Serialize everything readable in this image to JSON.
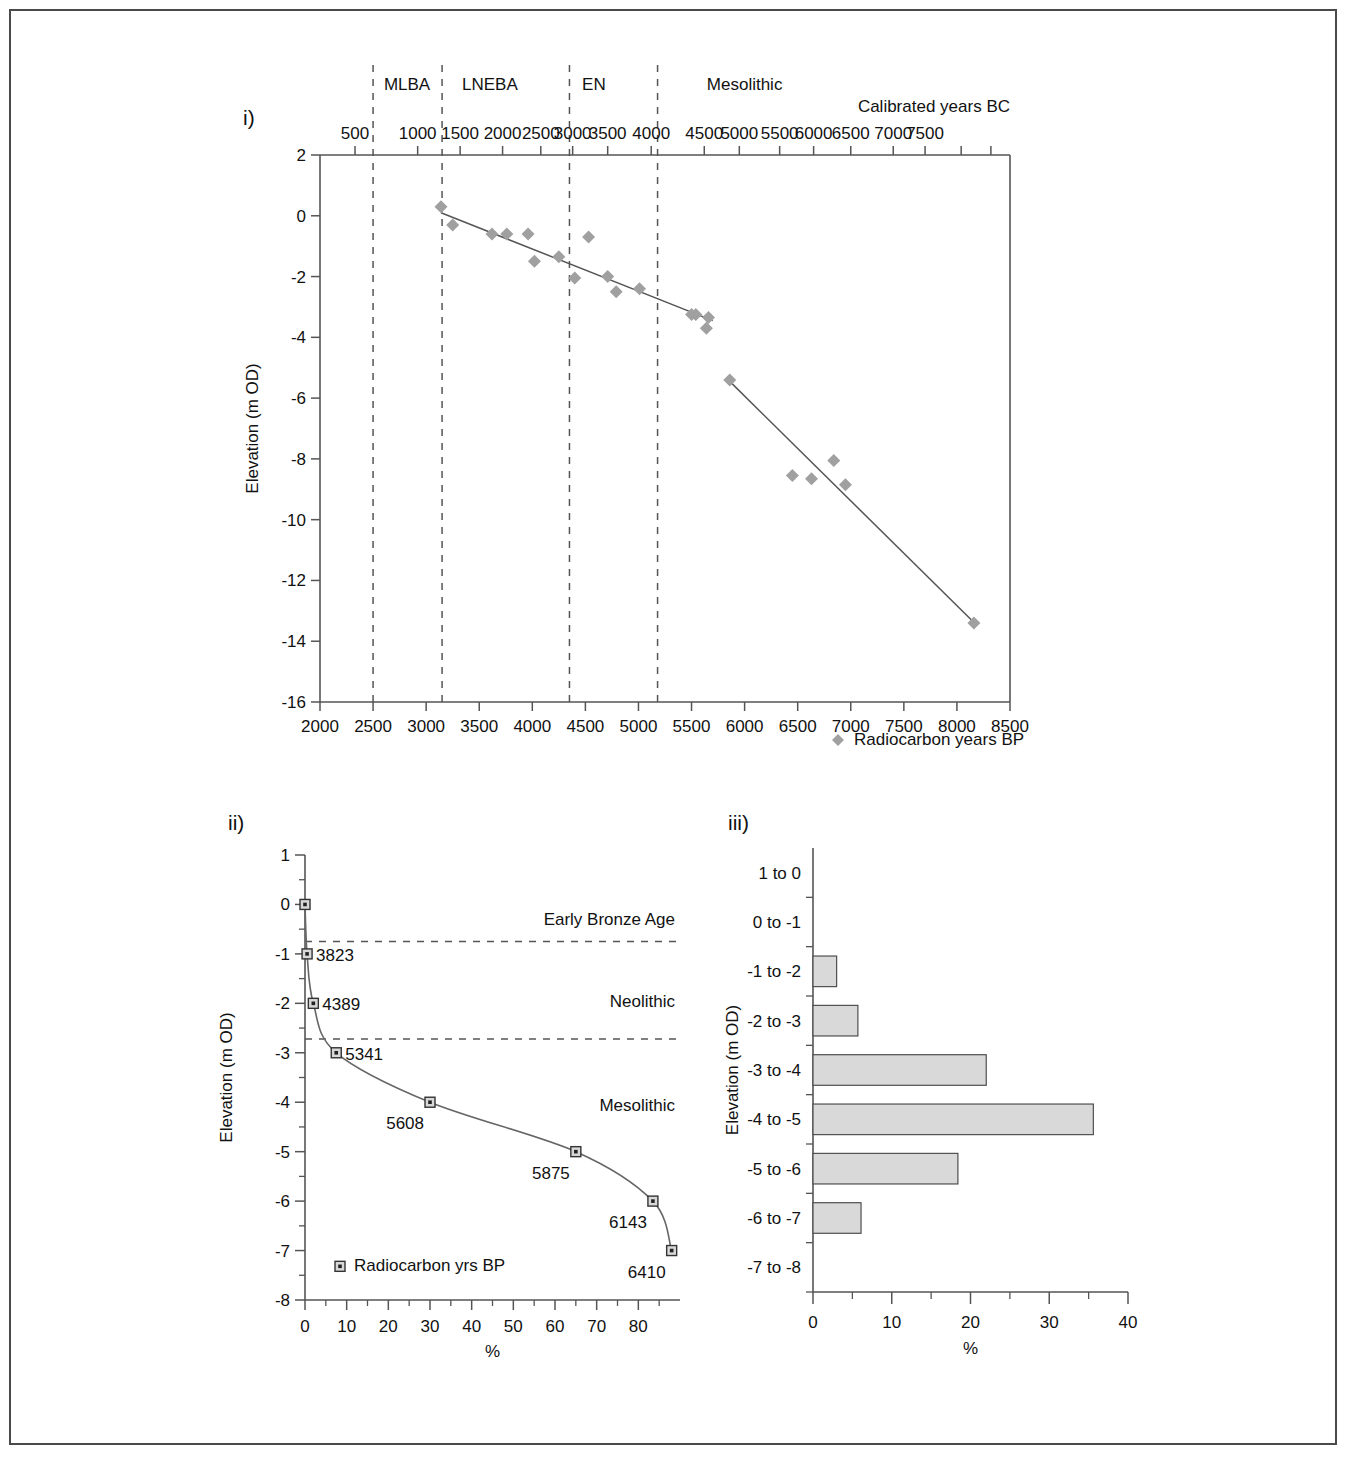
{
  "figure": {
    "panels": [
      {
        "id": "i",
        "label": "i)"
      },
      {
        "id": "ii",
        "label": "ii)"
      },
      {
        "id": "iii",
        "label": "iii)"
      }
    ]
  },
  "chart_data": [
    {
      "panel": "i",
      "type": "scatter",
      "title": "",
      "xlabel": "",
      "ylabel": "Elevation (m OD)",
      "xlim": [
        2000,
        8500
      ],
      "ylim": [
        -16,
        2
      ],
      "grid": false,
      "xticks": [
        2000,
        2500,
        3000,
        3500,
        4000,
        4500,
        5000,
        5500,
        6000,
        6500,
        7000,
        7500,
        8000,
        8500
      ],
      "xticklabels": [
        "2000",
        "2500",
        "3000",
        "3500",
        "4000",
        "4500",
        "5000",
        "5500",
        "6000",
        "6500",
        "7000",
        "7500",
        "8000",
        "8500"
      ],
      "yticks": [
        2,
        0,
        -2,
        -4,
        -6,
        -8,
        -10,
        -12,
        -14,
        -16
      ],
      "yticklabels": [
        "2",
        "0",
        "-2",
        "-4",
        "-6",
        "-8",
        "-10",
        "-12",
        "-14",
        "-16"
      ],
      "top_axis": {
        "label": "Calibrated years BC",
        "ticks_bp": [
          2330,
          2920,
          3320,
          3720,
          4080,
          4380,
          4710,
          5120,
          5620,
          5950,
          6330,
          6650,
          7000,
          7400,
          7700,
          8040,
          8320
        ],
        "ticklabels": [
          "500",
          "1000",
          "1500",
          "2000",
          "2500",
          "3000",
          "3500",
          "4000",
          "4500",
          "5000",
          "5500",
          "6000",
          "6500",
          "7000",
          "7500",
          "",
          ""
        ],
        "displayed": [
          "500",
          "1000",
          "1500",
          "2000",
          "2500",
          "3000",
          "3500",
          "4000",
          "4500",
          "5000",
          "5500",
          "6000",
          "6500",
          "7000",
          "7500"
        ]
      },
      "period_dividers_bp": [
        2500,
        3150,
        4350,
        5180
      ],
      "period_labels": [
        {
          "name": "MLBA",
          "bp": 2820
        },
        {
          "name": "LNEBA",
          "bp": 3600
        },
        {
          "name": "EN",
          "bp": 4580
        },
        {
          "name": "Mesolithic",
          "bp": 6000
        }
      ],
      "legend": {
        "label": "Radiocarbon years BP",
        "marker": "diamond"
      },
      "points": [
        {
          "x": 3140,
          "y": 0.3
        },
        {
          "x": 3250,
          "y": -0.3
        },
        {
          "x": 3620,
          "y": -0.6
        },
        {
          "x": 3760,
          "y": -0.6
        },
        {
          "x": 3960,
          "y": -0.6
        },
        {
          "x": 4020,
          "y": -1.5
        },
        {
          "x": 4250,
          "y": -1.35
        },
        {
          "x": 4400,
          "y": -2.05
        },
        {
          "x": 4530,
          "y": -0.7
        },
        {
          "x": 4710,
          "y": -2.0
        },
        {
          "x": 4790,
          "y": -2.5
        },
        {
          "x": 5010,
          "y": -2.4
        },
        {
          "x": 5500,
          "y": -3.25
        },
        {
          "x": 5540,
          "y": -3.25
        },
        {
          "x": 5660,
          "y": -3.35
        },
        {
          "x": 5640,
          "y": -3.7
        },
        {
          "x": 5860,
          "y": -5.4
        },
        {
          "x": 6450,
          "y": -8.55
        },
        {
          "x": 6630,
          "y": -8.65
        },
        {
          "x": 6840,
          "y": -8.05
        },
        {
          "x": 6950,
          "y": -8.85
        },
        {
          "x": 8160,
          "y": -13.4
        }
      ],
      "trendlines": [
        {
          "x1": 3140,
          "y1": 0.1,
          "x2": 5700,
          "y2": -3.45
        },
        {
          "x1": 5860,
          "y1": -5.45,
          "x2": 8180,
          "y2": -13.45
        }
      ]
    },
    {
      "panel": "ii",
      "type": "line",
      "title": "",
      "xlabel": "%",
      "ylabel": "Elevation (m OD)",
      "xlim": [
        0,
        90
      ],
      "ylim": [
        -8,
        1
      ],
      "grid": false,
      "xticks": [
        0,
        10,
        20,
        30,
        40,
        50,
        60,
        70,
        80
      ],
      "xticklabels": [
        "0",
        "10",
        "20",
        "30",
        "40",
        "50",
        "60",
        "70",
        "80"
      ],
      "yticks": [
        1,
        0,
        -1,
        -2,
        -3,
        -4,
        -5,
        -6,
        -7,
        -8
      ],
      "yticklabels": [
        "1",
        "0",
        "-1",
        "-2",
        "-3",
        "-4",
        "-5",
        "-6",
        "-7",
        "-8"
      ],
      "x": [
        0,
        0.5,
        2.0,
        7.5,
        30.0,
        65.0,
        83.5,
        88.0
      ],
      "y": [
        1.0,
        0.0,
        -1.0,
        -2.0,
        -3.0,
        -4.0,
        -5.0,
        -6.0
      ],
      "points": [
        {
          "x": 0.0,
          "y": 0.0,
          "label": ""
        },
        {
          "x": 0.5,
          "y": -1.0,
          "label": "3823"
        },
        {
          "x": 2.0,
          "y": -2.0,
          "label": "4389"
        },
        {
          "x": 7.5,
          "y": -3.0,
          "label": "5341"
        },
        {
          "x": 30.0,
          "y": -4.0,
          "label": "5608"
        },
        {
          "x": 65.0,
          "y": -5.0,
          "label": "5875"
        },
        {
          "x": 83.5,
          "y": -6.0,
          "label": "6143"
        },
        {
          "x": 88.0,
          "y": -7.0,
          "label": "6410"
        }
      ],
      "period_dividers_y": [
        -0.75,
        -2.72
      ],
      "period_labels": [
        {
          "name": "Early Bronze Age",
          "y": -0.3
        },
        {
          "name": "Neolithic",
          "y": -1.95
        },
        {
          "name": "Mesolithic",
          "y": -4.05
        }
      ],
      "legend": {
        "label": "Radiocarbon yrs BP",
        "marker": "square"
      }
    },
    {
      "panel": "iii",
      "type": "bar",
      "orientation": "horizontal",
      "title": "",
      "xlabel": "%",
      "ylabel": "Elevation (m OD)",
      "xlim": [
        0,
        40
      ],
      "grid": false,
      "xticks": [
        0,
        10,
        20,
        30,
        40
      ],
      "xticklabels": [
        "0",
        "10",
        "20",
        "30",
        "40"
      ],
      "categories": [
        "1 to 0",
        "0 to -1",
        "-1 to -2",
        "-2 to -3",
        "-3 to -4",
        "-4 to -5",
        "-5 to -6",
        "-6 to -7",
        "-7 to -8"
      ],
      "values": [
        0,
        0,
        3.0,
        5.7,
        22.0,
        35.6,
        18.4,
        6.1,
        0
      ]
    }
  ]
}
